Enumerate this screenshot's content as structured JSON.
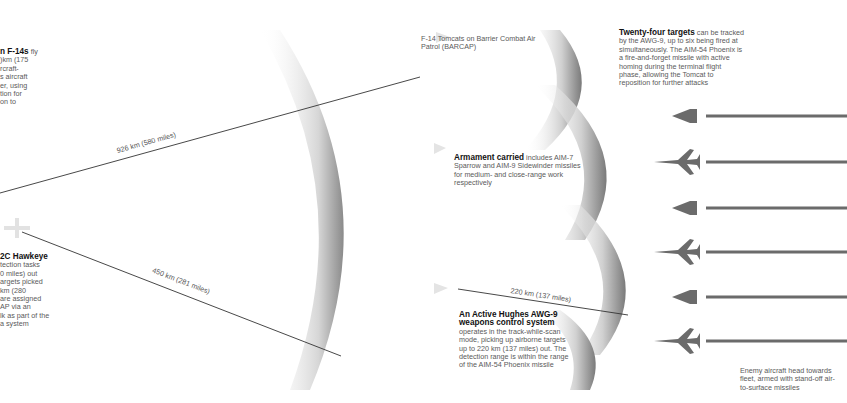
{
  "left_panel": {
    "f14_callout": {
      "title": "n F-14s",
      "body_lines": [
        " fly",
        ")km (175",
        "rcraft-",
        "s aircraft",
        "er, using",
        "tion for",
        "on to"
      ]
    },
    "hawkeye_callout": {
      "title": "2C Hawkeye",
      "body_lines": [
        "tection tasks",
        "0 miles) out",
        "argets picked",
        "km (280",
        "are assigned",
        "AP via an",
        "lk as part of the",
        "a system"
      ]
    },
    "distance_labels": {
      "long": "926 km (580 miles)",
      "short": "450 km (281 miles)"
    }
  },
  "middle_panel": {
    "barcap_caption": "F-14 Tomcats on Barrier Combat Air Patrol (BARCAP)",
    "armament": {
      "title": "Armament carried",
      "body": " includes AIM-7 Sparrow and AIM-9 Sidewinder missiles for medium- and close-range work respectively"
    },
    "range_label": "220 km (137 miles)",
    "awg9": {
      "title": "An Active Hughes AWG-9 weapons control system",
      "body": "operates in the track-while-scan mode, picking up airborne targets up to 220 km (137 miles) out. The detection range is within the range of the AIM-54 Phoenix missile"
    }
  },
  "right_panel": {
    "targets": {
      "title": "Twenty-four targets",
      "body": " can be tracked by the AWG-9, up to six being fired at simultaneously. The AIM-54 Phoenix is a fire-and-forget missile with active homing during the terminal flight phase, allowing the Tomcat to reposition for further attacks"
    },
    "enemy_caption": "Enemy aircraft head towards fleet, armed with stand-off air-to-surface missiles",
    "enemy_aircraft": [
      {
        "type": "delta",
        "y": 116
      },
      {
        "type": "swept",
        "y": 162
      },
      {
        "type": "delta",
        "y": 208
      },
      {
        "type": "swept",
        "y": 252
      },
      {
        "type": "delta",
        "y": 297
      },
      {
        "type": "swept",
        "y": 341
      }
    ]
  },
  "colors": {
    "arc_shadow": "#9a9a9a",
    "line": "#333333",
    "aircraft": "#6b6b6b",
    "heading": "#111111"
  }
}
